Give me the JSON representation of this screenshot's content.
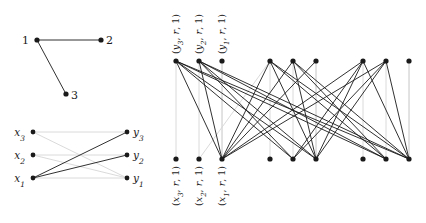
{
  "figure": {
    "title": "",
    "background_color": "#ffffff",
    "node_color": "#1a1a1a",
    "edge_dark_color": "#1a1a1a",
    "edge_light_color": "#d6d6d6"
  },
  "panels": {
    "top_left": {
      "name": "triangle-graph",
      "nodes": [
        {
          "id": "n1",
          "label": "1",
          "x": 37,
          "y": 40,
          "label_x": 29,
          "label_y": 44,
          "anchor": "end"
        },
        {
          "id": "n2",
          "label": "2",
          "x": 101,
          "y": 40,
          "label_x": 106,
          "label_y": 44,
          "anchor": "start"
        },
        {
          "id": "n3",
          "label": "3",
          "x": 66,
          "y": 94,
          "label_x": 71,
          "label_y": 99,
          "anchor": "start"
        }
      ],
      "edges": [
        {
          "from": "n1",
          "to": "n2",
          "style": "dark"
        },
        {
          "from": "n1",
          "to": "n3",
          "style": "dark"
        }
      ]
    },
    "bottom_left": {
      "name": "bipartite-xy-graph",
      "left_nodes": [
        {
          "id": "x3",
          "label": "x",
          "sub": "3",
          "x": 33,
          "y": 132,
          "label_x": 25,
          "label_y": 136,
          "anchor": "end"
        },
        {
          "id": "x2",
          "label": "x",
          "sub": "2",
          "x": 33,
          "y": 155,
          "label_x": 25,
          "label_y": 159,
          "anchor": "end"
        },
        {
          "id": "x1",
          "label": "x",
          "sub": "1",
          "x": 33,
          "y": 178,
          "label_x": 25,
          "label_y": 182,
          "anchor": "end"
        }
      ],
      "right_nodes": [
        {
          "id": "y3",
          "label": "y",
          "sub": "3",
          "x": 127,
          "y": 132,
          "label_x": 133,
          "label_y": 136,
          "anchor": "start"
        },
        {
          "id": "y2",
          "label": "y",
          "sub": "2",
          "x": 127,
          "y": 155,
          "label_x": 133,
          "label_y": 159,
          "anchor": "start"
        },
        {
          "id": "y1",
          "label": "y",
          "sub": "1",
          "x": 127,
          "y": 178,
          "label_x": 133,
          "label_y": 182,
          "anchor": "start"
        }
      ],
      "edges": [
        {
          "from": "x1",
          "to": "y3",
          "style": "dark"
        },
        {
          "from": "x1",
          "to": "y2",
          "style": "dark"
        },
        {
          "from": "x1",
          "to": "y1",
          "style": "light"
        },
        {
          "from": "x2",
          "to": "y1",
          "style": "light"
        },
        {
          "from": "x3",
          "to": "y1",
          "style": "light"
        },
        {
          "from": "x3",
          "to": "y3",
          "style": "light"
        },
        {
          "from": "x2",
          "to": "y2",
          "style": "light"
        }
      ]
    },
    "right": {
      "name": "product-bipartite-graph",
      "top_nodes": [
        {
          "id": "t1",
          "x": 176,
          "y": 61,
          "label": "(y",
          "sub": "3",
          "rest": ", r, 1)",
          "has_label": true
        },
        {
          "id": "t2",
          "x": 199,
          "y": 61,
          "label": "(y",
          "sub": "2",
          "rest": ", r, 1)",
          "has_label": true
        },
        {
          "id": "t3",
          "x": 222,
          "y": 61,
          "label": "(y",
          "sub": "1",
          "rest": ", r, 1)",
          "has_label": true
        },
        {
          "id": "t4",
          "x": 270,
          "y": 61,
          "has_label": false
        },
        {
          "id": "t5",
          "x": 293,
          "y": 61,
          "has_label": false
        },
        {
          "id": "t6",
          "x": 316,
          "y": 61,
          "has_label": false
        },
        {
          "id": "t7",
          "x": 363,
          "y": 61,
          "has_label": false
        },
        {
          "id": "t8",
          "x": 386,
          "y": 61,
          "has_label": false
        },
        {
          "id": "t9",
          "x": 409,
          "y": 61,
          "has_label": false
        }
      ],
      "bottom_nodes": [
        {
          "id": "b1",
          "x": 176,
          "y": 159,
          "label": "(x",
          "sub": "3",
          "rest": ", r, 1)",
          "has_label": true
        },
        {
          "id": "b2",
          "x": 199,
          "y": 159,
          "label": "(x",
          "sub": "2",
          "rest": ", r, 1)",
          "has_label": true
        },
        {
          "id": "b3",
          "x": 222,
          "y": 159,
          "label": "(x",
          "sub": "1",
          "rest": ", r, 1)",
          "has_label": true
        },
        {
          "id": "b4",
          "x": 270,
          "y": 159,
          "has_label": false
        },
        {
          "id": "b5",
          "x": 293,
          "y": 159,
          "has_label": false
        },
        {
          "id": "b6",
          "x": 316,
          "y": 159,
          "has_label": false
        },
        {
          "id": "b7",
          "x": 363,
          "y": 159,
          "has_label": false
        },
        {
          "id": "b8",
          "x": 386,
          "y": 159,
          "has_label": false
        },
        {
          "id": "b9",
          "x": 409,
          "y": 159,
          "has_label": false
        }
      ],
      "edges": [
        {
          "from": "t1",
          "to": "b1",
          "style": "light"
        },
        {
          "from": "t2",
          "to": "b2",
          "style": "light"
        },
        {
          "from": "t3",
          "to": "b3",
          "style": "light"
        },
        {
          "from": "t4",
          "to": "b4",
          "style": "light"
        },
        {
          "from": "t5",
          "to": "b5",
          "style": "light"
        },
        {
          "from": "t6",
          "to": "b6",
          "style": "light"
        },
        {
          "from": "t7",
          "to": "b7",
          "style": "light"
        },
        {
          "from": "t8",
          "to": "b8",
          "style": "light"
        },
        {
          "from": "t9",
          "to": "b9",
          "style": "light"
        },
        {
          "from": "t1",
          "to": "b3",
          "style": "dark"
        },
        {
          "from": "t1",
          "to": "b6",
          "style": "dark"
        },
        {
          "from": "t1",
          "to": "b9",
          "style": "dark"
        },
        {
          "from": "t1",
          "to": "b5",
          "style": "dark"
        },
        {
          "from": "t1",
          "to": "b8",
          "style": "dark"
        },
        {
          "from": "t2",
          "to": "b3",
          "style": "dark"
        },
        {
          "from": "t2",
          "to": "b6",
          "style": "dark"
        },
        {
          "from": "t2",
          "to": "b9",
          "style": "dark"
        },
        {
          "from": "t3",
          "to": "b3",
          "style": "light"
        },
        {
          "from": "t4",
          "to": "b3",
          "style": "dark"
        },
        {
          "from": "t4",
          "to": "b6",
          "style": "dark"
        },
        {
          "from": "t4",
          "to": "b9",
          "style": "dark"
        },
        {
          "from": "t4",
          "to": "b2",
          "style": "light"
        },
        {
          "from": "t5",
          "to": "b3",
          "style": "dark"
        },
        {
          "from": "t5",
          "to": "b6",
          "style": "dark"
        },
        {
          "from": "t5",
          "to": "b9",
          "style": "dark"
        },
        {
          "from": "t6",
          "to": "b3",
          "style": "dark"
        },
        {
          "from": "t6",
          "to": "b6",
          "style": "light"
        },
        {
          "from": "t7",
          "to": "b3",
          "style": "dark"
        },
        {
          "from": "t7",
          "to": "b6",
          "style": "dark"
        },
        {
          "from": "t7",
          "to": "b9",
          "style": "dark"
        },
        {
          "from": "t8",
          "to": "b3",
          "style": "dark"
        },
        {
          "from": "t8",
          "to": "b6",
          "style": "dark"
        },
        {
          "from": "t8",
          "to": "b9",
          "style": "dark"
        },
        {
          "from": "t9",
          "to": "b9",
          "style": "light"
        },
        {
          "from": "t2",
          "to": "b5",
          "style": "dark"
        },
        {
          "from": "t2",
          "to": "b8",
          "style": "dark"
        },
        {
          "from": "t5",
          "to": "b8",
          "style": "dark"
        },
        {
          "from": "t7",
          "to": "b5",
          "style": "dark"
        },
        {
          "from": "t4",
          "to": "b8",
          "style": "dark"
        },
        {
          "from": "t8",
          "to": "b5",
          "style": "dark"
        }
      ]
    }
  },
  "labels": {
    "top_left_nodes": [
      "1",
      "2",
      "3"
    ],
    "bottom_left_left": [
      "x3",
      "x2",
      "x1"
    ],
    "bottom_left_right": [
      "y3",
      "y2",
      "y1"
    ],
    "right_top": [
      "(y3, r, 1)",
      "(y2, r, 1)",
      "(y1, r, 1)"
    ],
    "right_bottom": [
      "(x3, r, 1)",
      "(x2, r, 1)",
      "(x1, r, 1)"
    ]
  }
}
